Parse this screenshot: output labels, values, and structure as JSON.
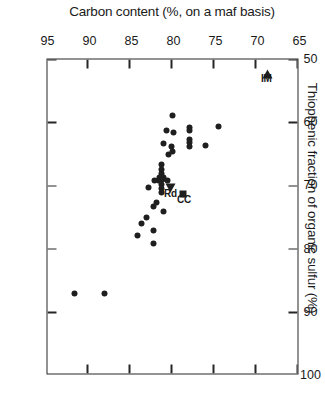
{
  "chart_data": {
    "type": "scatter",
    "title": "Thiophenic fraction of organic sulfur (%)",
    "xlabel": "Thiophenic fraction of organic sulfur (%)",
    "ylabel": "Carbon content (%, on a maf basis)",
    "xlim": [
      50,
      100
    ],
    "ylim": [
      65,
      95
    ],
    "y_axis_inverted": true,
    "grid": false,
    "legend": "none",
    "xticks": [
      50,
      60,
      70,
      80,
      90,
      100
    ],
    "yticks": [
      65,
      70,
      75,
      80,
      85,
      90,
      95
    ],
    "xtick_labels": [
      "50",
      "60",
      "70",
      "80",
      "90",
      "100"
    ],
    "ytick_labels": [
      "65",
      "70",
      "75",
      "80",
      "85",
      "90",
      "95"
    ],
    "marker_color": "#1f1f1f",
    "axis_color": "#262626",
    "background": "#ffffff",
    "series": [
      {
        "name": "coal samples",
        "marker": "circle",
        "points": [
          [
            60.6,
            74.4
          ],
          [
            63.6,
            75.9
          ],
          [
            60.8,
            77.9
          ],
          [
            61.3,
            77.9
          ],
          [
            62.6,
            77.8
          ],
          [
            63.1,
            77.8
          ],
          [
            63.8,
            77.9
          ],
          [
            58.9,
            79.9
          ],
          [
            61.6,
            79.8
          ],
          [
            63.8,
            80.0
          ],
          [
            64.6,
            79.9
          ],
          [
            65.0,
            80.3
          ],
          [
            61.3,
            80.6
          ],
          [
            63.3,
            80.9
          ],
          [
            66.6,
            81.2
          ],
          [
            67.4,
            81.2
          ],
          [
            68.0,
            81.2
          ],
          [
            68.6,
            81.0
          ],
          [
            68.6,
            81.4
          ],
          [
            69.0,
            81.1
          ],
          [
            69.2,
            81.5
          ],
          [
            69.8,
            81.2
          ],
          [
            70.4,
            81.2
          ],
          [
            71.1,
            81.2
          ],
          [
            69.1,
            80.5
          ],
          [
            69.1,
            82.0
          ],
          [
            74.0,
            80.9
          ],
          [
            72.6,
            81.8
          ],
          [
            73.2,
            82.2
          ],
          [
            70.3,
            82.7
          ],
          [
            77.0,
            82.1
          ],
          [
            79.1,
            82.1
          ],
          [
            75.0,
            83.0
          ],
          [
            76.0,
            83.6
          ],
          [
            77.8,
            84.0
          ],
          [
            87.0,
            88.0
          ],
          [
            87.1,
            91.5
          ]
        ]
      }
    ],
    "labeled_points": [
      {
        "label": "CC",
        "marker": "square",
        "x": 71.3,
        "y": 78.6
      },
      {
        "label": "Rd",
        "marker": "triangle",
        "x": 70.4,
        "y": 80.1
      },
      {
        "label": "IM",
        "marker": "triangle-left",
        "x": 52.2,
        "y": 68.6
      }
    ]
  }
}
